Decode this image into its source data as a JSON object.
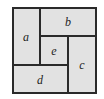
{
  "diagram": {
    "regions": [
      {
        "label": "a"
      },
      {
        "label": "b"
      },
      {
        "label": "e"
      },
      {
        "label": "c"
      },
      {
        "label": "d"
      }
    ],
    "colors": {
      "fill": "#e2e2e2",
      "stroke": "#2a2a2a"
    }
  }
}
